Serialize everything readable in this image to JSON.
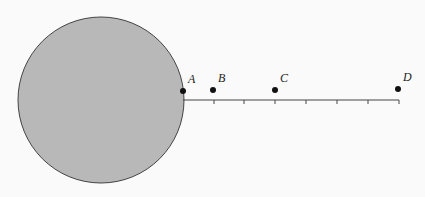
{
  "diagram": {
    "circle": {
      "cx": 101,
      "cy": 100,
      "r": 83,
      "fill": "#b8b8b8",
      "stroke": "#444444"
    },
    "line": {
      "x1": 183,
      "y1": 100,
      "x2": 399,
      "y2": 100,
      "stroke": "#444444"
    },
    "ticks": [
      214,
      244,
      275,
      306,
      337,
      368,
      399
    ],
    "points": [
      {
        "label": "A",
        "x": 183,
        "y": 91
      },
      {
        "label": "B",
        "x": 213,
        "y": 90
      },
      {
        "label": "C",
        "x": 275,
        "y": 90
      },
      {
        "label": "D",
        "x": 398,
        "y": 89
      }
    ]
  }
}
